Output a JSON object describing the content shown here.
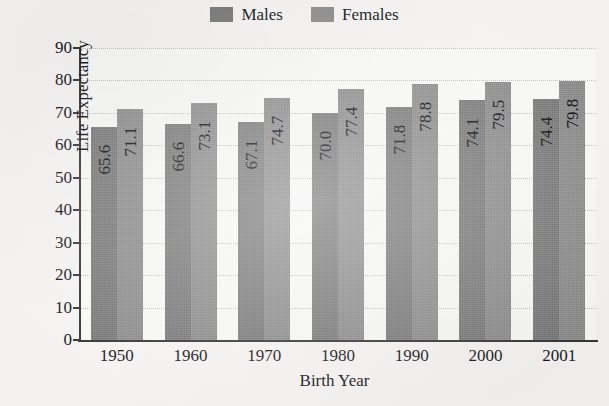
{
  "chart_data": {
    "type": "bar",
    "title": "",
    "xlabel": "Birth Year",
    "ylabel": "Life Expectancy",
    "categories": [
      "1950",
      "1960",
      "1970",
      "1980",
      "1990",
      "2000",
      "2001"
    ],
    "series": [
      {
        "name": "Males",
        "values": [
          65.6,
          66.6,
          67.1,
          70.0,
          71.8,
          74.1,
          74.4
        ],
        "color": "#7b7b7b"
      },
      {
        "name": "Females",
        "values": [
          71.1,
          73.1,
          74.7,
          77.4,
          78.8,
          79.5,
          79.8
        ],
        "color": "#8f8f8f"
      }
    ],
    "value_labels": [
      [
        "65.6",
        "71.1"
      ],
      [
        "66.6",
        "73.1"
      ],
      [
        "67.1",
        "74.7"
      ],
      [
        "70.0",
        "77.4"
      ],
      [
        "71.8",
        "78.8"
      ],
      [
        "74.1",
        "79.5"
      ],
      [
        "74.4",
        "79.8"
      ]
    ],
    "ylim": [
      0,
      90
    ],
    "yticks": [
      0,
      10,
      20,
      30,
      40,
      50,
      60,
      70,
      80,
      90
    ],
    "ytick_labels": [
      "0",
      "10",
      "20",
      "30",
      "40",
      "50",
      "60",
      "70",
      "80",
      "90"
    ],
    "grid": true,
    "grid_style": "dotted-horizontal",
    "legend_position": "top-center",
    "legend": [
      "Males",
      "Females"
    ],
    "value_label_orientation": "vertical-inside-bar"
  },
  "axes": {
    "y_title": "Life Expectancy",
    "x_title": "Birth Year"
  },
  "legend": {
    "items": [
      {
        "label": "Males",
        "color": "#7b7b7b"
      },
      {
        "label": "Females",
        "color": "#8f8f8f"
      }
    ]
  },
  "title_sliver": ""
}
